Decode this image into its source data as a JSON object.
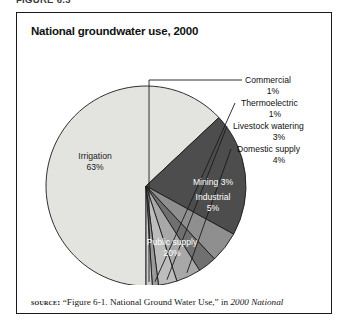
{
  "figure": {
    "caption": "FIGURE 6.3"
  },
  "chart": {
    "title": "National groundwater use, 2000"
  },
  "source": {
    "label": "source:",
    "text_before": " “Figure 6-1. National Ground Water Use,” in ",
    "italic_text": "2000 National"
  },
  "colors": {
    "irrigation": "#e3e3e0",
    "public_supply": "#4d4d4d",
    "industrial": "#8f8f8f",
    "mining": "#707070",
    "domestic_supply": "#a8a8a8",
    "livestock_watering": "#bdbdbd",
    "thermoelectric": "#9a9a9a",
    "commercial": "#cccccc",
    "outline": "#1a1a1a",
    "border": "#1a1a1a",
    "title_text": "#111111"
  },
  "chart_data": {
    "type": "pie",
    "title": "National groundwater use, 2000",
    "unit": "percent",
    "total": 100,
    "legend": "none",
    "labels": [
      "Irrigation",
      "Public supply",
      "Industrial",
      "Mining",
      "Domestic supply",
      "Livestock watering",
      "Thermoelectric",
      "Commercial"
    ],
    "values": [
      63,
      20,
      5,
      3,
      4,
      3,
      1,
      1
    ],
    "slices": [
      {
        "name": "Irrigation",
        "label": "Irrigation",
        "value": 63,
        "percent_text": "63%",
        "color": "#e3e3e0",
        "label_placement": "inside",
        "label_color": "#1c1c1c",
        "label_x": 78,
        "label_y": 146,
        "value_x": 78,
        "value_y": 157
      },
      {
        "name": "Public supply",
        "label": "Public supply",
        "value": 20,
        "percent_text": "20%",
        "color": "#4d4d4d",
        "label_placement": "inside",
        "label_color": "#ffffff",
        "label_x": 155,
        "label_y": 232,
        "value_x": 155,
        "value_y": 243
      },
      {
        "name": "Industrial",
        "label": "Industrial",
        "value": 5,
        "percent_text": "5%",
        "color": "#8f8f8f",
        "label_placement": "inside",
        "label_color": "#ffffff",
        "label_x": 196,
        "label_y": 187,
        "value_x": 196,
        "value_y": 198
      },
      {
        "name": "Mining",
        "label": "Mining 3%",
        "value": 3,
        "percent_text": "3%",
        "color": "#707070",
        "label_placement": "inside",
        "label_color": "#ffffff",
        "label_x": 196,
        "label_y": 172,
        "value_x": 0,
        "value_y": 0
      },
      {
        "name": "Domestic supply",
        "label": "Domestic supply",
        "value": 4,
        "percent_text": "4%",
        "color": "#a8a8a8",
        "label_placement": "callout",
        "label_color": "#101010",
        "label_x": 220,
        "label_y": 139,
        "value_x": 262,
        "value_y": 150
      },
      {
        "name": "Livestock watering",
        "label": "Livestock watering",
        "value": 3,
        "percent_text": "3%",
        "color": "#bdbdbd",
        "label_placement": "callout",
        "label_color": "#101010",
        "label_x": 216,
        "label_y": 116,
        "value_x": 262,
        "value_y": 127
      },
      {
        "name": "Thermoelectric",
        "label": "Thermoelectric",
        "value": 1,
        "percent_text": "1%",
        "color": "#9a9a9a",
        "label_placement": "callout",
        "label_color": "#101010",
        "label_x": 224,
        "label_y": 93,
        "value_x": 258,
        "value_y": 104
      },
      {
        "name": "Commercial",
        "label": "Commercial",
        "value": 1,
        "percent_text": "1%",
        "color": "#cccccc",
        "label_placement": "callout",
        "label_color": "#101010",
        "label_x": 228,
        "label_y": 70,
        "value_x": 256,
        "value_y": 81
      }
    ]
  }
}
